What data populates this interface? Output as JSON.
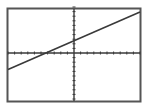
{
  "colors": {
    "background": "#ffffff",
    "ink": "#3a3a3a",
    "border": "#555555"
  },
  "chart_data": {
    "type": "line",
    "title": "",
    "xlabel": "",
    "ylabel": "",
    "xlim": [
      -10,
      10
    ],
    "ylim": [
      -10,
      10
    ],
    "grid": false,
    "axes_ticks": {
      "x_step": 1,
      "y_step": 1
    },
    "series": [
      {
        "name": "Y1",
        "x": [
          -10,
          10
        ],
        "y": [
          -3.6,
          8.9
        ]
      }
    ]
  }
}
